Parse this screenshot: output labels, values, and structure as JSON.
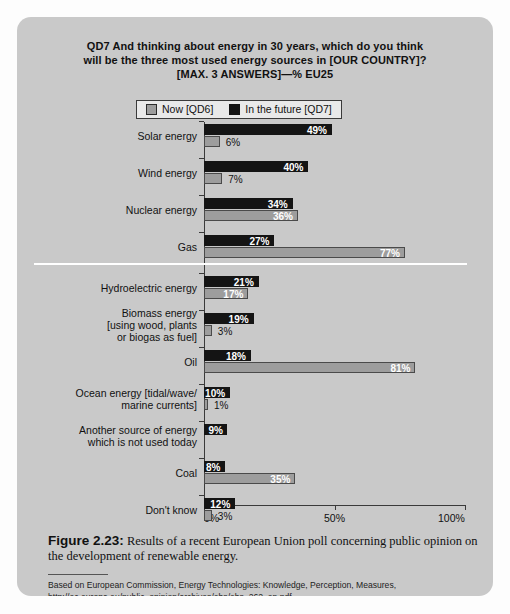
{
  "figure": {
    "title_lines": [
      "QD7 And thinking about energy in 30 years, which do you think",
      "will be the three most used energy sources in [OUR COUNTRY]?",
      "[MAX. 3 ANSWERS]—% EU25"
    ],
    "caption_label": "Figure 2.23:",
    "caption_text": " Results of a recent European Union poll concerning public opinion on the development of renewable energy.",
    "source": "Based on European Commission, Energy Technologies: Knowledge, Perception, Measures, http://ec.europa.eu/public_opinion/archives/ebs/ebs_262_en.pdf"
  },
  "legend": {
    "items": [
      {
        "label": "Now [QD6]",
        "swatch": "gray",
        "color": "#9d9d9d"
      },
      {
        "label": "In the future [QD7]",
        "swatch": "black",
        "color": "#141414"
      }
    ]
  },
  "chart_data": {
    "type": "bar",
    "orientation": "horizontal",
    "title": "QD7 And thinking about energy in 30 years, which do you think will be the three most used energy sources in [OUR COUNTRY]? [MAX. 3 ANSWERS]—% EU25",
    "xlabel": "",
    "ylabel": "",
    "xlim": [
      0,
      100
    ],
    "xticks": [
      0,
      50,
      100
    ],
    "xticklabels": [
      "0%",
      "50%",
      "100%"
    ],
    "grid": false,
    "legend_position": "top-center",
    "categories": [
      "Solar energy",
      "Wind energy",
      "Nuclear energy",
      "Gas",
      "Hydroelectric energy",
      "Biomass energy [using wood, plants or biogas as fuel]",
      "Oil",
      "Ocean energy [tidal/wave/ marine currents]",
      "Another source of energy which is not used today",
      "Coal",
      "Don't know"
    ],
    "series": [
      {
        "name": "In the future [QD7]",
        "color": "#141414",
        "values": [
          49,
          40,
          34,
          27,
          21,
          19,
          18,
          10,
          9,
          8,
          12
        ],
        "labels": [
          "49%",
          "40%",
          "34%",
          "27%",
          "21%",
          "19%",
          "18%",
          "10%",
          "9%",
          "8%",
          "12%"
        ]
      },
      {
        "name": "Now [QD6]",
        "color": "#9d9d9d",
        "values": [
          6,
          7,
          36,
          77,
          17,
          3,
          81,
          1,
          0,
          35,
          3
        ],
        "labels": [
          "6%",
          "7%",
          "36%",
          "77%",
          "17%",
          "3%",
          "81%",
          "1%",
          "",
          "35%",
          "3%"
        ]
      }
    ]
  },
  "rows": [
    {
      "cat_lines": [
        "Solar energy"
      ],
      "future": {
        "value": 49,
        "label": "49%",
        "label_inside": true
      },
      "now": {
        "value": 6,
        "label": "6%",
        "label_inside": false
      }
    },
    {
      "cat_lines": [
        "Wind energy"
      ],
      "future": {
        "value": 40,
        "label": "40%",
        "label_inside": true
      },
      "now": {
        "value": 7,
        "label": "7%",
        "label_inside": false
      }
    },
    {
      "cat_lines": [
        "Nuclear energy"
      ],
      "future": {
        "value": 34,
        "label": "34%",
        "label_inside": true
      },
      "now": {
        "value": 36,
        "label": "36%",
        "label_inside": true
      }
    },
    {
      "cat_lines": [
        "Gas"
      ],
      "future": {
        "value": 27,
        "label": "27%",
        "label_inside": true
      },
      "now": {
        "value": 77,
        "label": "77%",
        "label_inside": true
      }
    },
    {
      "cat_lines": [
        "Hydroelectric energy"
      ],
      "future": {
        "value": 21,
        "label": "21%",
        "label_inside": true
      },
      "now": {
        "value": 17,
        "label": "17%",
        "label_inside": true
      }
    },
    {
      "cat_lines": [
        "Biomass energy",
        "[using wood, plants",
        "or biogas as fuel]"
      ],
      "future": {
        "value": 19,
        "label": "19%",
        "label_inside": true
      },
      "now": {
        "value": 3,
        "label": "3%",
        "label_inside": false
      }
    },
    {
      "cat_lines": [
        "Oil"
      ],
      "future": {
        "value": 18,
        "label": "18%",
        "label_inside": true
      },
      "now": {
        "value": 81,
        "label": "81%",
        "label_inside": true
      }
    },
    {
      "cat_lines": [
        "Ocean energy [tidal/wave/",
        "marine currents]"
      ],
      "future": {
        "value": 10,
        "label": "10%",
        "label_inside": true
      },
      "now": {
        "value": 1,
        "label": "1%",
        "label_inside": false
      }
    },
    {
      "cat_lines": [
        "Another source of energy",
        "which is not used today"
      ],
      "future": {
        "value": 9,
        "label": "9%",
        "label_inside": true
      },
      "now": {
        "value": 0,
        "label": "",
        "label_inside": false
      }
    },
    {
      "cat_lines": [
        "Coal"
      ],
      "future": {
        "value": 8,
        "label": "8%",
        "label_inside": true
      },
      "now": {
        "value": 35,
        "label": "35%",
        "label_inside": true
      }
    },
    {
      "cat_lines": [
        "Don't know"
      ],
      "future": {
        "value": 12,
        "label": "12%",
        "label_inside": true
      },
      "now": {
        "value": 3,
        "label": "3%",
        "label_inside": false
      }
    }
  ]
}
